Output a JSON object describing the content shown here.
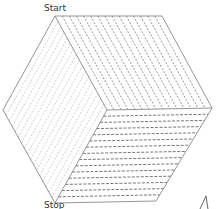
{
  "labels": {
    "start": "Start",
    "stop": "Stop"
  },
  "colors": {
    "outline": "#8a8a8a",
    "top_hatch": "#6a6a6a",
    "left_hatch": "#bdbdbd",
    "right_hatch": "#555555",
    "label": "#333333"
  },
  "geometry": {
    "top_left": [
      55,
      16
    ],
    "top_right": [
      162,
      16
    ],
    "right": [
      212,
      108
    ],
    "bottom_right": [
      156,
      201
    ],
    "bottom": [
      55,
      203
    ],
    "left": [
      3,
      110
    ],
    "center": [
      107,
      110
    ]
  },
  "faces": [
    {
      "name": "top-face",
      "hatch": "diagonal-down-right",
      "lines": 14
    },
    {
      "name": "left-face",
      "hatch": "diagonal-up-right",
      "lines": 16
    },
    {
      "name": "bottom-right-face",
      "hatch": "horizontal",
      "lines": 14
    }
  ]
}
